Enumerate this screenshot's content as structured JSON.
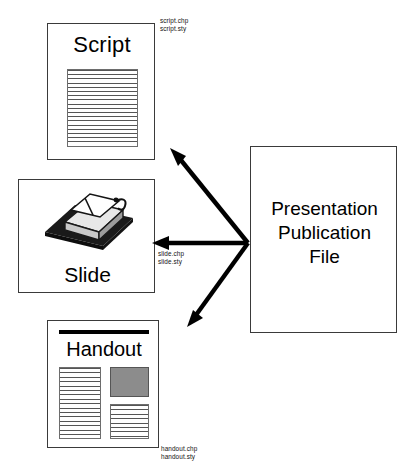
{
  "diagram": {
    "top_cut_text": "",
    "nodes": {
      "script": {
        "label": "Script",
        "files": [
          "script.chp",
          "script.sty"
        ],
        "content_icon": "lined-text-block-icon"
      },
      "slide": {
        "label": "Slide",
        "files": [
          "slide.chp",
          "slide.sty"
        ],
        "content_icon": "overhead-projector-icon"
      },
      "handout": {
        "label": "Handout",
        "files": [
          "handout.chp",
          "handout.sty"
        ],
        "content_icon": "two-column-layout-icon"
      },
      "publication": {
        "label_lines": [
          "Presentation",
          "Publication",
          "File"
        ]
      }
    },
    "arrows": [
      {
        "name": "arrow-to-script",
        "from": "publication",
        "to": "script"
      },
      {
        "name": "arrow-to-slide",
        "from": "publication",
        "to": "slide"
      },
      {
        "name": "arrow-to-handout",
        "from": "publication",
        "to": "handout"
      }
    ],
    "colors": {
      "ink": "#000000",
      "box_border": "#3a3a3a",
      "rule_line": "#555555",
      "gray_fill": "#8c8c8c",
      "background": "#ffffff"
    }
  }
}
